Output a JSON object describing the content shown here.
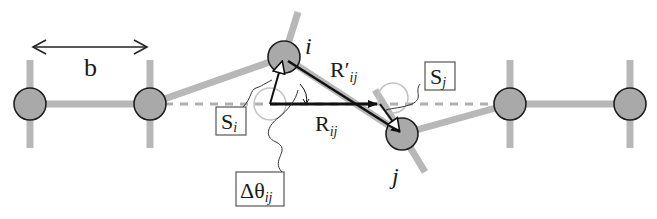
{
  "diagram": {
    "type": "chain displacement schematic",
    "colors": {
      "background": "#ffffff",
      "bond": "#b8b8b8",
      "node_fill": "#a9a9a9",
      "node_stroke": "#1f1f1f",
      "site_circle": "#bdbdbd",
      "dashed_line": "#b0b0b0",
      "vector": "#111111",
      "label_box": "#555555"
    },
    "labels": {
      "spacing": "b",
      "node_i": "i",
      "node_j": "j",
      "R_prime_main": "R′",
      "R_prime_sub": "ij",
      "R_main": "R",
      "R_sub": "ij",
      "S_i_main": "S",
      "S_i_sub": "i",
      "S_j_main": "S",
      "S_j_sub": "j",
      "dtheta_main": "Δθ",
      "dtheta_sub": "ij"
    },
    "nodes": [
      {
        "id": "n1",
        "x": 30,
        "y": 104
      },
      {
        "id": "n2",
        "x": 150,
        "y": 104
      },
      {
        "id": "i",
        "x": 284,
        "y": 57
      },
      {
        "id": "j",
        "x": 402,
        "y": 134
      },
      {
        "id": "n5",
        "x": 510,
        "y": 104
      },
      {
        "id": "n6",
        "x": 630,
        "y": 104
      }
    ],
    "lattice_sites": [
      {
        "id": "site-i",
        "x": 270,
        "y": 104
      },
      {
        "id": "site-j",
        "x": 393,
        "y": 92
      }
    ]
  }
}
